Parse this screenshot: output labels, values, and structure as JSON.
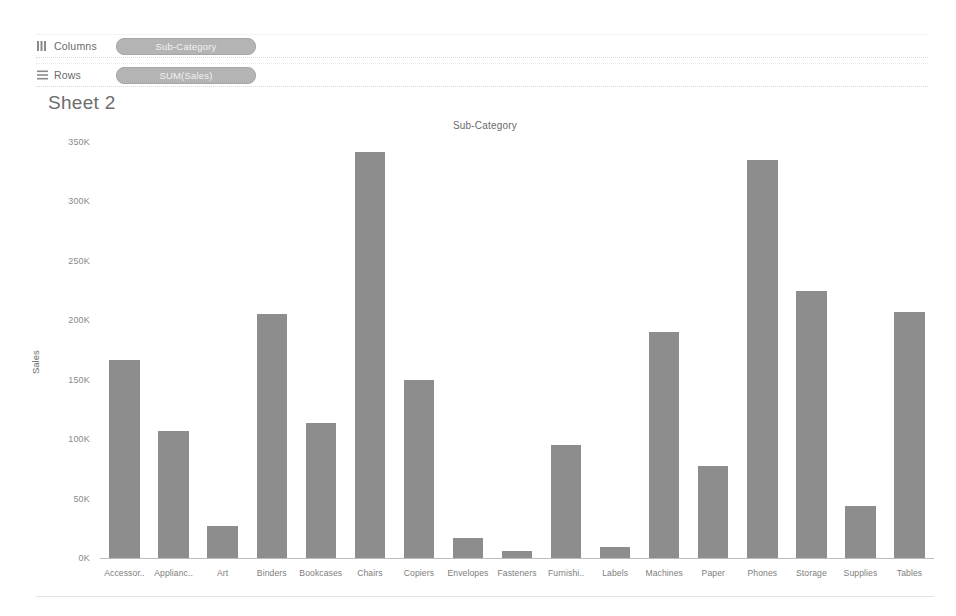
{
  "shelves": [
    {
      "icon": "columns-icon",
      "label": "Columns",
      "pill": "Sub-Category"
    },
    {
      "icon": "rows-icon",
      "label": "Rows",
      "pill": "SUM(Sales)"
    }
  ],
  "sheet": {
    "title": "Sheet 2"
  },
  "colors": {
    "bar": "#8d8d8d",
    "pill": "#b4b4b4",
    "axis": "#bdbdbd",
    "text": "#6a6a6a"
  },
  "chart_data": {
    "type": "bar",
    "title": "Sub-Category",
    "xlabel": "Sub-Category",
    "ylabel": "Sales",
    "ylim": [
      0,
      350
    ],
    "yunit": "K",
    "grid": false,
    "legend": "none",
    "ytick_labels": [
      "0K",
      "50K",
      "100K",
      "150K",
      "200K",
      "250K",
      "300K",
      "350K"
    ],
    "ytick_values": [
      0,
      50,
      100,
      150,
      200,
      250,
      300,
      350
    ],
    "categories": [
      "Accessor..",
      "Applianc..",
      "Art",
      "Binders",
      "Bookcases",
      "Chairs",
      "Copiers",
      "Envelopes",
      "Fasteners",
      "Furnishi..",
      "Labels",
      "Machines",
      "Paper",
      "Phones",
      "Storage",
      "Supplies",
      "Tables"
    ],
    "category_full": [
      "Accessories",
      "Appliances",
      "Art",
      "Binders",
      "Bookcases",
      "Chairs",
      "Copiers",
      "Envelopes",
      "Fasteners",
      "Furnishings",
      "Labels",
      "Machines",
      "Paper",
      "Phones",
      "Storage",
      "Supplies",
      "Tables"
    ],
    "values": [
      167,
      107,
      27,
      205,
      114,
      342,
      150,
      17,
      6,
      95,
      9,
      190,
      77,
      335,
      225,
      44,
      207
    ]
  }
}
